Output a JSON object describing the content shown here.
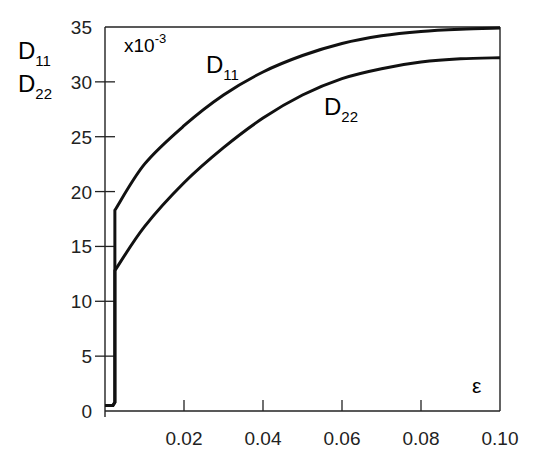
{
  "chart_data": {
    "type": "line",
    "title": "",
    "xlabel": "ε",
    "ylabel": [
      "D11",
      "D22"
    ],
    "y_scale_note": "x10^-3",
    "xlim": [
      0,
      0.1
    ],
    "ylim": [
      0,
      35
    ],
    "x_ticks": [
      "0.02",
      "0.04",
      "0.06",
      "0.08",
      "0.10"
    ],
    "y_ticks": [
      "0",
      "5",
      "10",
      "15",
      "20",
      "25",
      "30",
      "35"
    ],
    "grid": false,
    "legend": "inline labels",
    "series": [
      {
        "name": "D11",
        "x": [
          0,
          0.002,
          0.0025,
          0.0025,
          0.01,
          0.02,
          0.03,
          0.04,
          0.05,
          0.06,
          0.07,
          0.08,
          0.09,
          0.1
        ],
        "y": [
          0.5,
          0.5,
          0.8,
          18.3,
          22.5,
          26.0,
          28.8,
          30.9,
          32.4,
          33.5,
          34.2,
          34.6,
          34.8,
          34.9
        ]
      },
      {
        "name": "D22",
        "x": [
          0,
          0.002,
          0.0025,
          0.0025,
          0.01,
          0.02,
          0.03,
          0.04,
          0.05,
          0.06,
          0.07,
          0.08,
          0.09,
          0.1
        ],
        "y": [
          0.5,
          0.5,
          0.8,
          12.8,
          16.8,
          20.8,
          24.0,
          26.7,
          28.8,
          30.3,
          31.2,
          31.8,
          32.1,
          32.2
        ]
      }
    ]
  },
  "labels": {
    "y_label_1_main": "D",
    "y_label_1_sub": "11",
    "y_label_2_main": "D",
    "y_label_2_sub": "22",
    "scale_main": "x10",
    "scale_sup": "-3",
    "curve1_main": "D",
    "curve1_sub": "11",
    "curve2_main": "D",
    "curve2_sub": "22",
    "xlabel": "ε"
  }
}
